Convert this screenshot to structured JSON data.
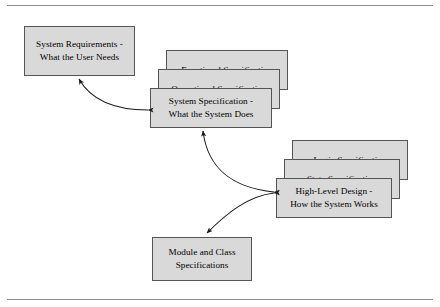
{
  "figure": {
    "background_color": "#ffffff",
    "box_fill_color": "#d9d9d9",
    "box_border_color": "#555555",
    "rule_color": "#8e8e8e",
    "arrow_color": "#1a1a1a"
  },
  "nodes": {
    "system_requirements": {
      "label": "System Requirements -\nWhat the User Needs"
    },
    "functional_specification": {
      "label": "Functional Specification"
    },
    "operational_specification": {
      "label": "Operational Specification"
    },
    "system_specification": {
      "label": "System Specification -\nWhat the System Does"
    },
    "logic_specification": {
      "label": "Logic Specification"
    },
    "state_specification": {
      "label": "State Specification"
    },
    "high_level_design": {
      "label": "High-Level Design -\nHow the System Works"
    },
    "module_and_class_specifications": {
      "label": "Module and Class\nSpecifications"
    }
  },
  "connections": [
    {
      "name": "system-specification-to-system-requirements",
      "from": "system_specification",
      "to": "system_requirements",
      "style": "double-headed-curve"
    },
    {
      "name": "high-level-design-to-system-specification",
      "from": "high_level_design",
      "to": "system_specification",
      "style": "double-headed-curve"
    },
    {
      "name": "high-level-design-to-module-and-class-specifications",
      "from": "high_level_design",
      "to": "module_and_class_specifications",
      "style": "double-headed-curve"
    }
  ]
}
